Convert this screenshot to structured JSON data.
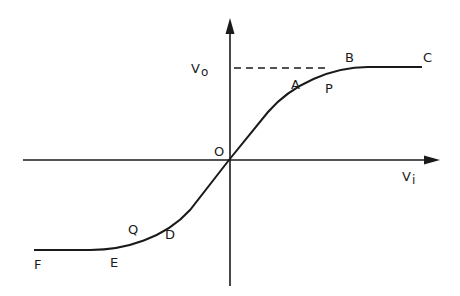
{
  "diagram": {
    "type": "transfer-characteristic",
    "axes": {
      "x_label_main": "V",
      "x_label_sub": "i",
      "y_label_main": "V",
      "y_label_sub": "o",
      "origin_label": "O"
    },
    "points": {
      "A": "A",
      "B": "B",
      "C": "C",
      "P": "P",
      "D": "D",
      "E": "E",
      "F": "F",
      "Q": "Q"
    },
    "colors": {
      "ink": "#1a1a1a",
      "background": "#ffffff"
    }
  }
}
